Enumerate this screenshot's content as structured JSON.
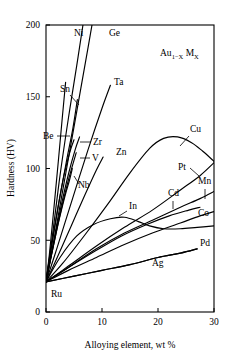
{
  "chart_data": {
    "type": "line",
    "title": "",
    "annotation": {
      "base": "Au",
      "sub1": "1−X",
      "mid": "M",
      "sub2": "X",
      "full": "Au1-X MX"
    },
    "xlabel": "Alloying element, wt %",
    "ylabel": "Hardness (HV)",
    "xlim": [
      0,
      30
    ],
    "ylim": [
      0,
      200
    ],
    "xticks": [
      0,
      10,
      20,
      30
    ],
    "xtick_labels": [
      "0",
      "10",
      "20",
      "30"
    ],
    "yticks": [
      0,
      50,
      100,
      150,
      200
    ],
    "ytick_labels": [
      "0",
      "50",
      "100",
      "150",
      "200"
    ],
    "grid": false,
    "legend": "inline-labels",
    "base_hardness": 21,
    "series": [
      {
        "name": "Ni",
        "label": "Ni",
        "label_x": 74,
        "label_y": 36,
        "points": [
          [
            0,
            21
          ],
          [
            1.2,
            55
          ],
          [
            2.5,
            95
          ],
          [
            4.0,
            135
          ],
          [
            5.5,
            172
          ],
          [
            6.6,
            200
          ]
        ]
      },
      {
        "name": "Ge",
        "label": "Ge",
        "label_x": 109,
        "label_y": 36,
        "points": [
          [
            0,
            21
          ],
          [
            1.5,
            52
          ],
          [
            3.5,
            96
          ],
          [
            5.5,
            140
          ],
          [
            7.5,
            184
          ],
          [
            8.3,
            202
          ]
        ]
      },
      {
        "name": "Ta",
        "label": "Ta",
        "label_x": 114,
        "label_y": 85,
        "points": [
          [
            0,
            21
          ],
          [
            2.0,
            45
          ],
          [
            4.5,
            76
          ],
          [
            7.5,
            113
          ],
          [
            10.0,
            142
          ],
          [
            11.5,
            158
          ]
        ]
      },
      {
        "name": "Sn",
        "label": "Sn",
        "label_x": 60,
        "label_y": 92,
        "points": [
          [
            0,
            21
          ],
          [
            1.0,
            46
          ],
          [
            2.2,
            74
          ],
          [
            3.6,
            104
          ],
          [
            4.8,
            128
          ],
          [
            5.6,
            148
          ]
        ]
      },
      {
        "name": "Be",
        "label": "Be",
        "label_x": 43,
        "label_y": 139,
        "points": [
          [
            0,
            21
          ],
          [
            0.9,
            44
          ],
          [
            2.0,
            70
          ],
          [
            3.2,
            95
          ],
          [
            4.3,
            112
          ],
          [
            5.0,
            120
          ]
        ]
      },
      {
        "name": "Zr",
        "label": "Zr",
        "label_x": 93,
        "label_y": 145,
        "points": [
          [
            0,
            21
          ],
          [
            1.2,
            45
          ],
          [
            2.6,
            72
          ],
          [
            4.0,
            96
          ],
          [
            5.2,
            113
          ],
          [
            6.0,
            122
          ]
        ]
      },
      {
        "name": "V",
        "label": "V",
        "label_x": 92,
        "label_y": 161,
        "points": [
          [
            0,
            21
          ],
          [
            1.1,
            42
          ],
          [
            2.4,
            66
          ],
          [
            3.8,
            89
          ],
          [
            4.8,
            103
          ],
          [
            5.4,
            111
          ]
        ]
      },
      {
        "name": "Nb",
        "label": "Nb",
        "label_x": 78,
        "label_y": 188,
        "points": [
          [
            0,
            21
          ],
          [
            1.0,
            40
          ],
          [
            2.2,
            62
          ],
          [
            3.4,
            81
          ],
          [
            4.2,
            92
          ],
          [
            4.7,
            100
          ]
        ]
      },
      {
        "name": "Zn",
        "label": "Zn",
        "label_x": 116,
        "label_y": 155,
        "points": [
          [
            0,
            21
          ],
          [
            2.0,
            38
          ],
          [
            4.5,
            60
          ],
          [
            7.0,
            82
          ],
          [
            9.0,
            99
          ],
          [
            10.2,
            108
          ]
        ]
      },
      {
        "name": "Cu",
        "label": "Cu",
        "label_x": 190,
        "label_y": 132,
        "points": [
          [
            0,
            21
          ],
          [
            3.0,
            34
          ],
          [
            7.0,
            54
          ],
          [
            11.0,
            75
          ],
          [
            15.0,
            97
          ],
          [
            18.5,
            114
          ],
          [
            21.0,
            121
          ],
          [
            23.5,
            122
          ],
          [
            26.0,
            118
          ],
          [
            28.0,
            112
          ],
          [
            30.0,
            105
          ]
        ]
      },
      {
        "name": "Pt",
        "label": "Pt",
        "label_x": 178,
        "label_y": 170,
        "points": [
          [
            0,
            21
          ],
          [
            4.0,
            32
          ],
          [
            9.0,
            46
          ],
          [
            14.0,
            59
          ],
          [
            19.0,
            71
          ],
          [
            24.0,
            85
          ],
          [
            27.5,
            95
          ],
          [
            30.0,
            104
          ]
        ]
      },
      {
        "name": "Mn",
        "label": "Mn",
        "label_x": 198,
        "label_y": 184,
        "points": [
          [
            0,
            21
          ],
          [
            4.0,
            31
          ],
          [
            9.0,
            44
          ],
          [
            14.0,
            55
          ],
          [
            19.0,
            64
          ],
          [
            24.0,
            73
          ],
          [
            27.5,
            79
          ],
          [
            30.0,
            84
          ]
        ]
      },
      {
        "name": "Cd",
        "label": "Cd",
        "label_x": 168,
        "label_y": 196,
        "points": [
          [
            0,
            21
          ],
          [
            4.0,
            31
          ],
          [
            9.0,
            43
          ],
          [
            13.5,
            53
          ],
          [
            18.0,
            61
          ],
          [
            22.0,
            67
          ],
          [
            25.5,
            71
          ],
          [
            27.5,
            73
          ]
        ]
      },
      {
        "name": "In",
        "label": "In",
        "label_x": 129,
        "label_y": 209,
        "points": [
          [
            0,
            21
          ],
          [
            2.5,
            38
          ],
          [
            5.5,
            53
          ],
          [
            8.5,
            61
          ],
          [
            11.5,
            65
          ],
          [
            14.0,
            66
          ],
          [
            16.5,
            63
          ],
          [
            18.5,
            60
          ],
          [
            21.0,
            58
          ],
          [
            24.0,
            58
          ],
          [
            27.0,
            59
          ],
          [
            30.0,
            60
          ]
        ]
      },
      {
        "name": "Co",
        "label": "Co",
        "label_x": 198,
        "label_y": 216,
        "points": [
          [
            0,
            21
          ],
          [
            4.0,
            29
          ],
          [
            9.0,
            38
          ],
          [
            14.0,
            47
          ],
          [
            19.0,
            55
          ],
          [
            24.0,
            62
          ],
          [
            27.5,
            67
          ],
          [
            30.0,
            70
          ]
        ]
      },
      {
        "name": "Pd",
        "label": "Pd",
        "label_x": 200,
        "label_y": 246,
        "points": [
          [
            0,
            21
          ],
          [
            5.0,
            25
          ],
          [
            10.0,
            29
          ],
          [
            15.0,
            33
          ],
          [
            20.0,
            38
          ],
          [
            24.0,
            41
          ],
          [
            27.0,
            44
          ]
        ]
      },
      {
        "name": "Ag",
        "label": "Ag",
        "label_x": 152,
        "label_y": 266,
        "points": [
          [
            0,
            21
          ],
          [
            5.0,
            25
          ],
          [
            10.0,
            29
          ],
          [
            15.0,
            33
          ],
          [
            20.0,
            38
          ],
          [
            24.0,
            41
          ],
          [
            27.0,
            44
          ]
        ]
      },
      {
        "name": "Ru",
        "label": "Ru",
        "label_x": 51,
        "label_y": 297,
        "points": [
          [
            0,
            21
          ],
          [
            0.6,
            40
          ],
          [
            1.4,
            72
          ],
          [
            2.2,
            105
          ],
          [
            2.9,
            135
          ],
          [
            3.5,
            160
          ]
        ]
      }
    ],
    "leaders": [
      {
        "for": "Sn",
        "x1": 70,
        "y1": 95,
        "x2": 79,
        "y2": 105
      },
      {
        "for": "Be",
        "x1": 57,
        "y1": 136,
        "x2": 70,
        "y2": 136
      },
      {
        "for": "Zr",
        "x1": 91,
        "y1": 142,
        "x2": 80,
        "y2": 142
      },
      {
        "for": "V",
        "x1": 90,
        "y1": 158,
        "x2": 80,
        "y2": 158
      },
      {
        "for": "Nb",
        "x1": 79,
        "y1": 184,
        "x2": 74,
        "y2": 176
      },
      {
        "for": "Cu",
        "x1": 189,
        "y1": 136,
        "x2": 180,
        "y2": 146
      },
      {
        "for": "Pt",
        "x1": 190,
        "y1": 168,
        "x2": 199,
        "y2": 176
      },
      {
        "for": "Mn",
        "x1": 205,
        "y1": 189,
        "x2": 205,
        "y2": 199
      },
      {
        "for": "Cd",
        "x1": 173,
        "y1": 201,
        "x2": 173,
        "y2": 209
      },
      {
        "for": "In",
        "x1": 127,
        "y1": 211,
        "x2": 119,
        "y2": 216
      }
    ]
  }
}
